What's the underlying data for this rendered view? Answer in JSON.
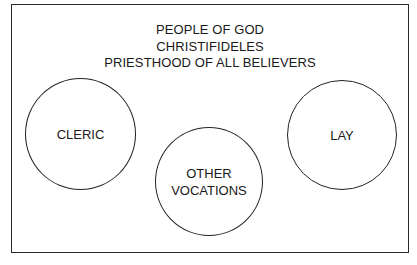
{
  "diagram": {
    "title_lines": [
      "PEOPLE OF GOD",
      "CHRISTIFIDELES",
      "PRIESTHOOD OF ALL BELIEVERS"
    ],
    "circles": [
      {
        "id": "cleric",
        "label_lines": [
          "CLERIC"
        ]
      },
      {
        "id": "other-vocations",
        "label_lines": [
          "OTHER",
          "VOCATIONS"
        ]
      },
      {
        "id": "lay",
        "label_lines": [
          "LAY"
        ]
      }
    ],
    "colors": {
      "stroke": "#222222",
      "text": "#1a1a1a",
      "background": "#ffffff"
    }
  }
}
